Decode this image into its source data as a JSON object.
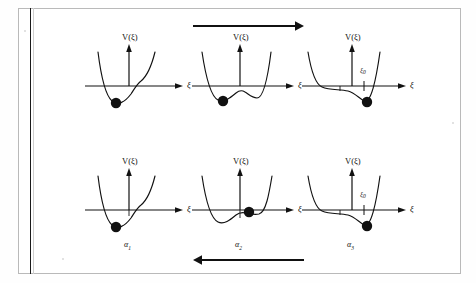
{
  "figure": {
    "type": "physics-potential-diagram-grid",
    "rows": 2,
    "cols": 3,
    "axis": {
      "vertical_label": "V(ξ)",
      "horizontal_label": "ξ",
      "marker_label": "ξ",
      "marker_subscript": "0"
    },
    "arrows": {
      "top": {
        "name": "forward-arrow",
        "direction": "right",
        "label": ""
      },
      "bottom": {
        "name": "reverse-arrow",
        "direction": "left",
        "label": ""
      }
    },
    "panels": [
      {
        "id": "top-left",
        "row": 0,
        "col": 0,
        "v_label": "V(ξ)",
        "x_label": "ξ",
        "alpha_label": "",
        "xi0_label": "",
        "ball_position": "left-single-minimum",
        "well_type": "single-well"
      },
      {
        "id": "top-center",
        "row": 0,
        "col": 1,
        "v_label": "V(ξ)",
        "x_label": "ξ",
        "alpha_label": "",
        "xi0_label": "",
        "ball_position": "left-well",
        "well_type": "double-well"
      },
      {
        "id": "top-right",
        "row": 0,
        "col": 2,
        "v_label": "V(ξ)",
        "x_label": "ξ",
        "alpha_label": "",
        "xi0_label": "ξ",
        "xi0_subscript": "0",
        "ball_position": "right-deep-well",
        "well_type": "asymmetric-double-well"
      },
      {
        "id": "bottom-left",
        "row": 1,
        "col": 0,
        "v_label": "V(ξ)",
        "x_label": "ξ",
        "alpha_label": "α",
        "alpha_subscript": "1",
        "xi0_label": "",
        "ball_position": "left-single-minimum",
        "well_type": "single-well"
      },
      {
        "id": "bottom-center",
        "row": 1,
        "col": 1,
        "v_label": "V(ξ)",
        "x_label": "ξ",
        "alpha_label": "α",
        "alpha_subscript": "2",
        "xi0_label": "",
        "ball_position": "right-shallow-well",
        "well_type": "double-well"
      },
      {
        "id": "bottom-right",
        "row": 1,
        "col": 2,
        "v_label": "V(ξ)",
        "x_label": "ξ",
        "alpha_label": "α",
        "alpha_subscript": "3",
        "xi0_label": "ξ",
        "xi0_subscript": "0",
        "ball_position": "right-deep-well",
        "well_type": "asymmetric-double-well"
      }
    ],
    "colors": {
      "ink": "#111111",
      "page": "#ffffff",
      "border": "#b9b9b9",
      "gutter": "#1a1a1a"
    }
  }
}
